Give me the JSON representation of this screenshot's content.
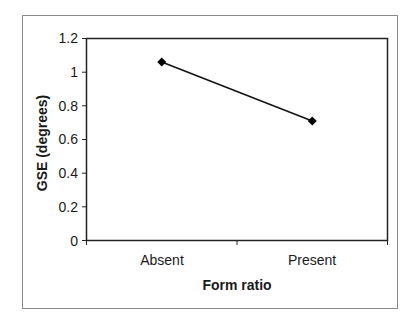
{
  "chart_data": {
    "type": "line",
    "title": "",
    "xlabel": "Form ratio",
    "ylabel": "GSE (degrees)",
    "categories": [
      "Absent",
      "Present"
    ],
    "series": [
      {
        "name": "GSE",
        "values": [
          1.06,
          0.71
        ],
        "marker": "diamond",
        "color": "#000000"
      }
    ],
    "ylim": [
      0,
      1.2
    ],
    "yticks": [
      "0",
      "0.2",
      "0.4",
      "0.6",
      "0.8",
      "1",
      "1.2"
    ],
    "grid": false,
    "legend": "none"
  },
  "axis": {
    "yticks": {
      "t0": "0",
      "t1": "0.2",
      "t2": "0.4",
      "t3": "0.6",
      "t4": "0.8",
      "t5": "1",
      "t6": "1.2"
    },
    "categories": {
      "c0": "Absent",
      "c1": "Present"
    },
    "xlabel": "Form ratio",
    "ylabel": "GSE (degrees)"
  }
}
